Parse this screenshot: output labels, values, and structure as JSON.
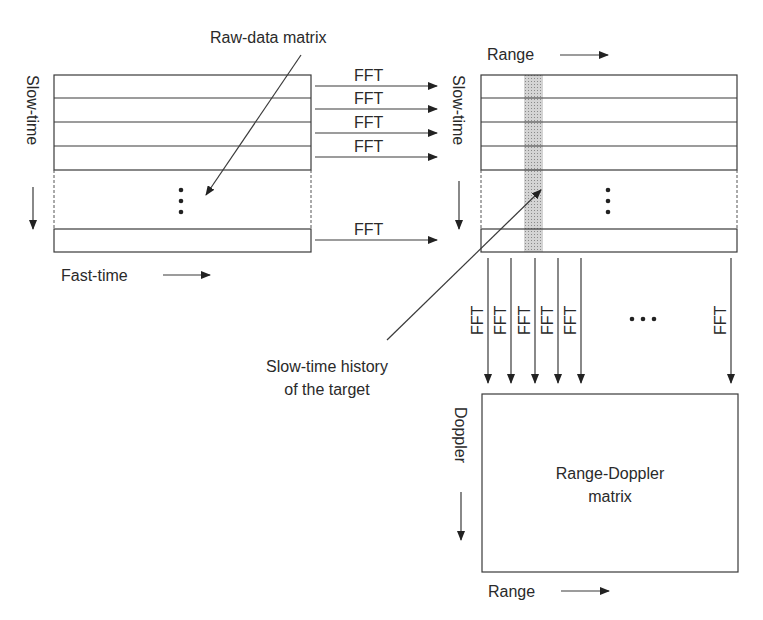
{
  "diagram": {
    "raw_matrix": {
      "callout": "Raw-data matrix",
      "vertical_axis": "Slow-time",
      "horizontal_axis": "Fast-time",
      "ellipsis": "⋮"
    },
    "range_matrix": {
      "top_axis": "Range",
      "vertical_axis": "Slow-time",
      "ellipsis": "⋮",
      "highlight_color": "#c8c8c8"
    },
    "fast_time_fft": {
      "labels": [
        "FFT",
        "FFT",
        "FFT",
        "FFT",
        "FFT"
      ]
    },
    "slow_time_fft": {
      "labels": [
        "FFT",
        "FFT",
        "FFT",
        "FFT",
        "FFT",
        "FFT"
      ],
      "ellipsis": "• • •"
    },
    "target_callout": {
      "line1": "Slow-time history",
      "line2": "of the target"
    },
    "rd_matrix": {
      "label_line1": "Range-Doppler",
      "label_line2": "matrix",
      "vertical_axis": "Doppler",
      "horizontal_axis": "Range"
    }
  }
}
